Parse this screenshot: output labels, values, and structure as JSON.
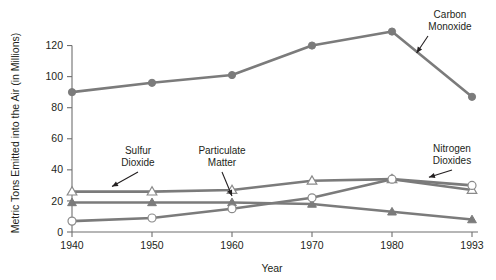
{
  "chart_data": {
    "type": "line",
    "title": "",
    "xlabel": "Year",
    "ylabel": "Metric Tons Emitted into the Air (in Millions)",
    "categories": [
      "1940",
      "1950",
      "1960",
      "1970",
      "1980",
      "1993"
    ],
    "x": [
      1940,
      1950,
      1960,
      1970,
      1980,
      1993
    ],
    "xtick_labels": [
      "1940",
      "1950",
      "1960",
      "1970",
      "1980",
      "1993"
    ],
    "ytick_labels": [
      "0",
      "20",
      "40",
      "60",
      "80",
      "100",
      "120"
    ],
    "yticks": [
      0,
      20,
      40,
      60,
      80,
      100,
      120
    ],
    "ylim": [
      0,
      130
    ],
    "grid": false,
    "legend_position": "none",
    "series": [
      {
        "name": "Carbon Monoxide",
        "marker": "filled-circle",
        "color": "#7b7b7b",
        "values": [
          90,
          96,
          101,
          120,
          129,
          87
        ]
      },
      {
        "name": "Sulfur Dioxide",
        "marker": "open-triangle",
        "color": "#7b7b7b",
        "values": [
          26,
          26,
          27,
          33,
          34,
          27
        ]
      },
      {
        "name": "Particulate Matter",
        "marker": "filled-triangle",
        "color": "#7b7b7b",
        "values": [
          19,
          19,
          19,
          18,
          13,
          8
        ]
      },
      {
        "name": "Nitrogen Dioxides",
        "marker": "open-circle",
        "color": "#7b7b7b",
        "values": [
          7,
          9,
          15,
          22,
          34,
          30
        ]
      }
    ],
    "annotations": [
      {
        "id": "sulfur-dioxide",
        "text_line1": "Sulfur",
        "text_line2": "Dioxide",
        "target_x": 1945,
        "target_y": 26
      },
      {
        "id": "particulate-matter",
        "text_line1": "Particulate",
        "text_line2": "Matter",
        "target_x": 1960,
        "target_y": 20
      },
      {
        "id": "nitrogen-dioxides",
        "text_line1": "Nitrogen",
        "text_line2": "Dioxides",
        "target_x": 1986,
        "target_y": 32
      },
      {
        "id": "carbon-monoxide",
        "text_line1": "Carbon",
        "text_line2": "Monoxide",
        "target_x": 1984,
        "target_y": 112
      }
    ]
  }
}
